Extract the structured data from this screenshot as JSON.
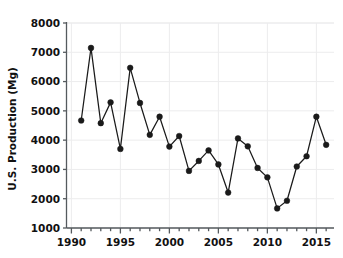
{
  "chart_data": {
    "type": "line",
    "title": "",
    "xlabel": "",
    "ylabel": "U.S. Production (Mg)",
    "xlim": [
      1989.5,
      2016.8
    ],
    "ylim": [
      1000,
      8000
    ],
    "grid": true,
    "legend": "none",
    "marker": "filled-circle",
    "line_color": "#1a1a1a",
    "marker_color": "#1a1a1a",
    "x_tick_labels": [
      "1990",
      "1995",
      "2000",
      "2005",
      "2010",
      "2015"
    ],
    "x_tick_values": [
      1990,
      1995,
      2000,
      2005,
      2010,
      2015
    ],
    "x_minor_tick_interval": 1,
    "y_tick_labels": [
      "1000",
      "2000",
      "3000",
      "4000",
      "5000",
      "6000",
      "7000",
      "8000"
    ],
    "y_tick_values": [
      1000,
      2000,
      3000,
      4000,
      5000,
      6000,
      7000,
      8000
    ],
    "x": [
      1991,
      1992,
      1993,
      1994,
      1995,
      1996,
      1997,
      1998,
      1999,
      2000,
      2001,
      2002,
      2003,
      2004,
      2005,
      2006,
      2007,
      2008,
      2009,
      2010,
      2011,
      2012,
      2013,
      2014,
      2015,
      2016
    ],
    "values": [
      4670,
      7150,
      4580,
      5290,
      3700,
      6470,
      5270,
      4180,
      4800,
      3780,
      4140,
      2950,
      3290,
      3650,
      3170,
      2210,
      4060,
      3790,
      3050,
      2730,
      1670,
      1930,
      3100,
      3450,
      4800,
      3840
    ],
    "series": [
      {
        "name": "U.S. Production",
        "values": [
          4670,
          7150,
          4580,
          5290,
          3700,
          6470,
          5270,
          4180,
          4800,
          3780,
          4140,
          2950,
          3290,
          3650,
          3170,
          2210,
          4060,
          3790,
          3050,
          2730,
          1670,
          1930,
          3100,
          3450,
          4800,
          3840
        ]
      }
    ]
  },
  "axes": {
    "y_axis_label": "U.S. Production (Mg)"
  }
}
